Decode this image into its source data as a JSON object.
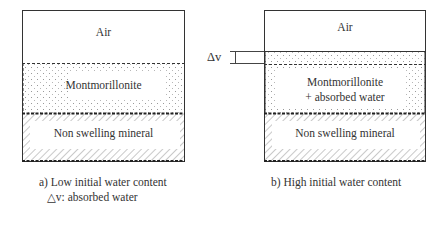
{
  "panel_a": {
    "layers": {
      "air": "Air",
      "montmorillonite": "Montmorillonite",
      "non_swelling": "Non swelling mineral"
    },
    "caption_line1": "a) Low initial water content",
    "caption_line2": "△v: absorbed water"
  },
  "panel_b": {
    "layers": {
      "air": "Air",
      "montmorillonite_line1": "Montmorillonite",
      "montmorillonite_line2": "+ absorbed water",
      "non_swelling": "Non swelling mineral"
    },
    "delta_label": "Δv",
    "caption": "b) High initial water content"
  }
}
